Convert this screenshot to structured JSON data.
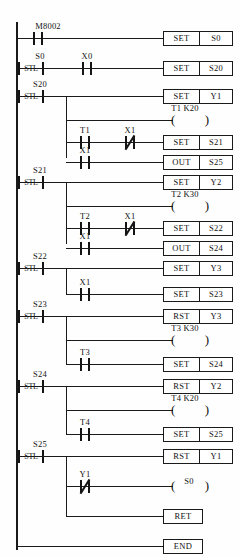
{
  "diagram": {
    "type": "plc-ladder-stl",
    "rails": {
      "left": true,
      "right": false
    }
  },
  "networks": [
    {
      "id": "nw1",
      "elements": [
        {
          "kind": "contact-no",
          "device": "M8002"
        },
        {
          "kind": "box",
          "op": "SET",
          "arg": "S0"
        }
      ]
    },
    {
      "id": "nw2",
      "elements": [
        {
          "kind": "stl",
          "device": "S0",
          "text": "STL"
        },
        {
          "kind": "contact-no",
          "device": "X0"
        },
        {
          "kind": "box",
          "op": "SET",
          "arg": "S20"
        }
      ]
    },
    {
      "id": "nw3",
      "elements": [
        {
          "kind": "stl",
          "device": "S20",
          "text": "STL"
        },
        {
          "kind": "box",
          "op": "SET",
          "arg": "Y1"
        },
        {
          "kind": "coil",
          "device": "T1",
          "preset": "K20",
          "label": "T1 K20"
        },
        {
          "kind": "contact-no",
          "device": "T1"
        },
        {
          "kind": "contact-nc",
          "device": "X1"
        },
        {
          "kind": "box",
          "op": "SET",
          "arg": "S21"
        },
        {
          "kind": "contact-no",
          "device": "X1"
        },
        {
          "kind": "box",
          "op": "OUT",
          "arg": "S25"
        }
      ]
    },
    {
      "id": "nw4",
      "elements": [
        {
          "kind": "stl",
          "device": "S21",
          "text": "STL"
        },
        {
          "kind": "box",
          "op": "SET",
          "arg": "Y2"
        },
        {
          "kind": "coil",
          "device": "T2",
          "preset": "K30",
          "label": "T2 K30"
        },
        {
          "kind": "contact-no",
          "device": "T2"
        },
        {
          "kind": "contact-nc",
          "device": "X1"
        },
        {
          "kind": "box",
          "op": "SET",
          "arg": "S22"
        },
        {
          "kind": "contact-no",
          "device": "X1"
        },
        {
          "kind": "box",
          "op": "OUT",
          "arg": "S24"
        }
      ]
    },
    {
      "id": "nw5",
      "elements": [
        {
          "kind": "stl",
          "device": "S22",
          "text": "STL"
        },
        {
          "kind": "box",
          "op": "SET",
          "arg": "Y3"
        },
        {
          "kind": "contact-no",
          "device": "X1"
        },
        {
          "kind": "box",
          "op": "SET",
          "arg": "S23"
        }
      ]
    },
    {
      "id": "nw6",
      "elements": [
        {
          "kind": "stl",
          "device": "S23",
          "text": "STL"
        },
        {
          "kind": "box",
          "op": "RST",
          "arg": "Y3"
        },
        {
          "kind": "coil",
          "device": "T3",
          "preset": "K30",
          "label": "T3 K30"
        },
        {
          "kind": "contact-no",
          "device": "T3"
        },
        {
          "kind": "box",
          "op": "SET",
          "arg": "S24"
        }
      ]
    },
    {
      "id": "nw7",
      "elements": [
        {
          "kind": "stl",
          "device": "S24",
          "text": "STL"
        },
        {
          "kind": "box",
          "op": "RST",
          "arg": "Y2"
        },
        {
          "kind": "coil",
          "device": "T4",
          "preset": "K20",
          "label": "T4 K20"
        },
        {
          "kind": "contact-no",
          "device": "T4"
        },
        {
          "kind": "box",
          "op": "SET",
          "arg": "S25"
        }
      ]
    },
    {
      "id": "nw8",
      "elements": [
        {
          "kind": "stl",
          "device": "S25",
          "text": "STL"
        },
        {
          "kind": "box",
          "op": "RST",
          "arg": "Y1"
        },
        {
          "kind": "contact-nc",
          "device": "Y1"
        },
        {
          "kind": "coil",
          "device": "S0",
          "label": "S0"
        },
        {
          "kind": "box",
          "op": "RET"
        }
      ]
    },
    {
      "id": "nw9",
      "elements": [
        {
          "kind": "box",
          "op": "END"
        }
      ]
    }
  ],
  "labels": {
    "m8002": "M8002",
    "s0": "S0",
    "s20": "S20",
    "s21": "S21",
    "s22": "S22",
    "s23": "S23",
    "s24": "S24",
    "s25": "S25",
    "x0": "X0",
    "x1": "X1",
    "y1": "Y1",
    "t1": "T1",
    "t2": "T2",
    "t3": "T3",
    "t4": "T4",
    "stl": "STL",
    "t1k20": "T1 K20",
    "t2k30": "T2 K30",
    "t3k30": "T3 K30",
    "t4k20": "T4 K20",
    "s0coil": "S0"
  },
  "ops": {
    "set": "SET",
    "out": "OUT",
    "rst": "RST",
    "ret": "RET",
    "end": "END"
  },
  "operands": {
    "s0": "S0",
    "s20": "S20",
    "s21": "S21",
    "s22": "S22",
    "s23": "S23",
    "s24": "S24",
    "s25": "S25",
    "y1": "Y1",
    "y2": "Y2",
    "y3": "Y3"
  },
  "colors": {
    "line": "#1a1a1a",
    "text": "#111111",
    "background": "#ffffff"
  }
}
